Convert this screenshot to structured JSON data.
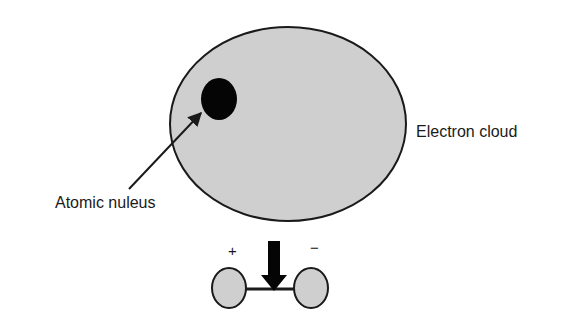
{
  "labels": {
    "electron_cloud": "Electron cloud",
    "nucleus": "Atomic nuleus",
    "plus": "+",
    "minus": "−"
  },
  "colors": {
    "cloud_fill": "#cfcfcf",
    "stroke": "#1a1a1a",
    "nucleus_fill": "#050505",
    "background": "#ffffff"
  },
  "shapes": {
    "electron_cloud": {
      "cx": 288,
      "cy": 124,
      "rx": 118,
      "ry": 97
    },
    "nucleus": {
      "cx": 219,
      "cy": 99,
      "rx": 18,
      "ry": 21
    },
    "dipole_left": {
      "cx": 229,
      "cy": 288,
      "rx": 17,
      "ry": 20
    },
    "dipole_right": {
      "cx": 311,
      "cy": 288,
      "rx": 17,
      "ry": 20
    }
  }
}
